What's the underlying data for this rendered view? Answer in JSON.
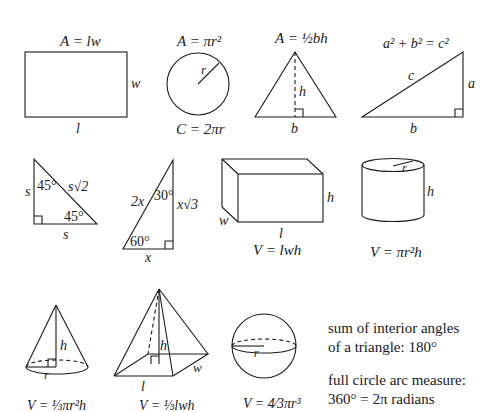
{
  "reference": {
    "rectangle": {
      "formula": "A = lw",
      "length_label": "l",
      "width_label": "w"
    },
    "circle": {
      "area_formula": "A = πr²",
      "circumference_formula": "C = 2πr",
      "radius_label": "r"
    },
    "triangle": {
      "formula": "A = ½bh",
      "base_label": "b",
      "height_label": "h"
    },
    "right_triangle": {
      "formula": "a² + b² = c²",
      "hypotenuse_label": "c",
      "leg_a_label": "a",
      "leg_b_label": "b"
    },
    "special_45": {
      "leg_label": "s",
      "leg2_label": "s",
      "hyp_label": "s√2",
      "angle1": "45°",
      "angle2": "45°"
    },
    "special_30_60": {
      "hyp_label": "2x",
      "long_leg_label": "x√3",
      "short_leg_label": "x",
      "angle_top": "30°",
      "angle_bottom": "60°"
    },
    "rect_prism": {
      "formula": "V = lwh",
      "length_label": "l",
      "width_label": "w",
      "height_label": "h"
    },
    "cylinder": {
      "formula": "V = πr²h",
      "radius_label": "r",
      "height_label": "h"
    },
    "cone": {
      "formula": "V = ⅓πr²h",
      "radius_label": "r",
      "height_label": "h"
    },
    "pyramid": {
      "formula": "V = ⅓lwh",
      "length_label": "l",
      "width_label": "w",
      "height_label": "h"
    },
    "sphere": {
      "formula": "V = 4⁄3πr³",
      "radius_label": "r"
    },
    "notes": [
      {
        "line1": "sum of interior angles",
        "line2": "of a triangle: 180°"
      },
      {
        "line1": "full circle arc measure:",
        "line2": "360° = 2π radians"
      }
    ]
  }
}
